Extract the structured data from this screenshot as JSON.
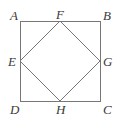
{
  "figure": {
    "type": "geometry-diagram",
    "canvas": {
      "width": 117,
      "height": 124
    },
    "background_color": "#ffffff",
    "stroke_color": "#777777",
    "stroke_width": 1,
    "label_color": "#3a3a3a",
    "outer_shape": {
      "name": "square-ABCD",
      "vertices": [
        {
          "label": "A",
          "x": 20,
          "y": 21,
          "position": "top-left"
        },
        {
          "label": "B",
          "x": 100,
          "y": 21,
          "position": "top-right"
        },
        {
          "label": "C",
          "x": 100,
          "y": 101,
          "position": "bottom-right"
        },
        {
          "label": "D",
          "x": 20,
          "y": 101,
          "position": "bottom-left"
        }
      ],
      "path": "M 20 21 L 100 21 L 100 101 L 20 101 Z"
    },
    "inner_shape": {
      "name": "square-EFGH",
      "vertices": [
        {
          "label": "E",
          "x": 20,
          "y": 61,
          "position": "left-midpoint"
        },
        {
          "label": "F",
          "x": 60,
          "y": 21,
          "position": "top-midpoint"
        },
        {
          "label": "G",
          "x": 100,
          "y": 61,
          "position": "right-midpoint"
        },
        {
          "label": "H",
          "x": 60,
          "y": 101,
          "position": "bottom-midpoint"
        }
      ],
      "path": "M 20 61 L 60 21 L 100 61 L 60 101 Z"
    },
    "labels": {
      "A": "A",
      "B": "B",
      "C": "C",
      "D": "D",
      "E": "E",
      "F": "F",
      "G": "G",
      "H": "H"
    }
  }
}
